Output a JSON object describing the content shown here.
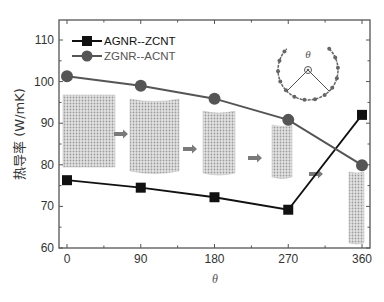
{
  "chart_data": {
    "type": "line",
    "title": "",
    "xlabel": "θ",
    "ylabel": "热导率 (W/mK)",
    "x": [
      0,
      90,
      180,
      270,
      360
    ],
    "x_tick_labels": [
      "0",
      "90",
      "180",
      "270",
      "360"
    ],
    "y_tick_labels": [
      "60",
      "70",
      "80",
      "90",
      "100",
      "110"
    ],
    "xlim": [
      -15,
      375
    ],
    "ylim": [
      60,
      115
    ],
    "grid": false,
    "legend_position": "upper left",
    "series": [
      {
        "name": "AGNR--ZCNT",
        "marker": "square",
        "color": "#111111",
        "values": [
          76.3,
          74.5,
          72.2,
          69.2,
          92.0
        ]
      },
      {
        "name": "ZGNR--ACNT",
        "marker": "circle",
        "color": "#555555",
        "values": [
          101.3,
          99.0,
          95.9,
          90.8,
          79.9
        ]
      }
    ],
    "annotations": [
      "inset: nanotube structure images rolling from flat ribbon to tube, connected by arrows",
      "inset: arc diagram illustrating rolling angle θ"
    ]
  },
  "labels": {
    "ylabel": "热导率 (W/mK)",
    "xlabel": "θ",
    "inset_theta": "θ"
  }
}
